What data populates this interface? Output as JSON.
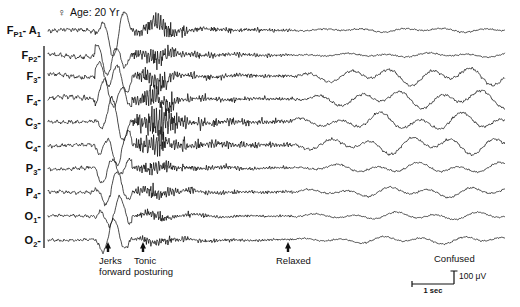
{
  "header": {
    "sex_symbol": "♀",
    "patient_info": "Age: 20 Yr"
  },
  "channels": [
    {
      "name": "Fp1-A1",
      "base": "F",
      "sub": "P1",
      "suffix": "- A",
      "ref_sub": "1",
      "y": 30
    },
    {
      "name": "Fp2-",
      "base": "F",
      "sub": "P2",
      "suffix": "-",
      "ref_sub": "",
      "y": 55
    },
    {
      "name": "F3-",
      "base": "F",
      "sub": "3",
      "suffix": "-",
      "ref_sub": "",
      "y": 76
    },
    {
      "name": "F4-",
      "base": "F",
      "sub": "4",
      "suffix": "-",
      "ref_sub": "",
      "y": 99
    },
    {
      "name": "C3-",
      "base": "C",
      "sub": "3",
      "suffix": "-",
      "ref_sub": "",
      "y": 122
    },
    {
      "name": "C4-",
      "base": "C",
      "sub": "4",
      "suffix": "-",
      "ref_sub": "",
      "y": 145
    },
    {
      "name": "P3-",
      "base": "P",
      "sub": "3",
      "suffix": "-",
      "ref_sub": "",
      "y": 168
    },
    {
      "name": "P4-",
      "base": "P",
      "sub": "4",
      "suffix": "-",
      "ref_sub": "",
      "y": 192
    },
    {
      "name": "O1-",
      "base": "O",
      "sub": "1",
      "suffix": "-",
      "ref_sub": "",
      "y": 216
    },
    {
      "name": "O2-",
      "base": "O",
      "sub": "2",
      "suffix": "-",
      "ref_sub": "",
      "y": 240
    }
  ],
  "annotations": [
    {
      "id": "jerks-forward",
      "line1": "Jerks",
      "line2": "forward",
      "arrow_x": 108,
      "text_x": 99,
      "text_y": 264
    },
    {
      "id": "tonic-posturing",
      "line1": "Tonic",
      "line2": "posturing",
      "arrow_x": 143,
      "text_x": 134,
      "text_y": 264
    },
    {
      "id": "relaxed",
      "line1": "Relaxed",
      "line2": "",
      "arrow_x": 288,
      "text_x": 276,
      "text_y": 264
    },
    {
      "id": "confused",
      "line1": "Confused",
      "line2": "",
      "arrow_x": null,
      "text_x": 434,
      "text_y": 262
    }
  ],
  "calibration": {
    "time_label": "1 sec",
    "amplitude_label": "100 μV",
    "x": 412,
    "y": 284,
    "width": 42,
    "height": 13
  },
  "chart_data": {
    "type": "line",
    "xlabel": "Time",
    "ylabel": "Channel (referential montage to A1)",
    "grid": false,
    "legend": null,
    "x_range_seconds": [
      0,
      19.6
    ],
    "seconds_per_pixel": 0.0429,
    "amplitude_scale_uv_per_px": 7.7,
    "n_channels": 10,
    "trace_x_start": 48,
    "trace_x_end": 505,
    "categories": [
      "Fp1-A1",
      "Fp2-",
      "F3-",
      "F4-",
      "C3-",
      "C4-",
      "P3-",
      "P4-",
      "O1-",
      "O2-"
    ],
    "phases": [
      {
        "name": "interictal baseline",
        "x_start": 48,
        "x_end": 95,
        "description": "low-voltage irregular background activity"
      },
      {
        "name": "movement artifact / jerks",
        "x_start": 95,
        "x_end": 130,
        "description": "large slow high-amplitude deflections from body jerking"
      },
      {
        "name": "tonic phase",
        "x_start": 130,
        "x_end": 180,
        "description": "high-frequency rhythmic low-amplitude fast activity with EMG"
      },
      {
        "name": "clonic / muscle artifact",
        "x_start": 180,
        "x_end": 290,
        "description": "bursts of muscle artifact decreasing in amplitude"
      },
      {
        "name": "post-ictal slowing",
        "x_start": 290,
        "x_end": 505,
        "description": "rhythmic high-amplitude delta slowing, confusion"
      }
    ],
    "series": [
      {
        "name": "Fp1-A1",
        "baseline_y": 30,
        "bursts": "slow-roll artifact then attenuation then mixed delta"
      },
      {
        "name": "Fp2-",
        "baseline_y": 55,
        "bursts": "slow-roll artifact then fast EMG then delta"
      },
      {
        "name": "F3-",
        "baseline_y": 76,
        "bursts": "strong tonic fast activity then rhythmic delta"
      },
      {
        "name": "F4-",
        "baseline_y": 99,
        "bursts": "strong tonic fast activity then rhythmic delta"
      },
      {
        "name": "C3-",
        "baseline_y": 122,
        "bursts": "highest amplitude EMG burst then delta"
      },
      {
        "name": "C4-",
        "baseline_y": 145,
        "bursts": "EMG burst then rhythmic delta"
      },
      {
        "name": "P3-",
        "baseline_y": 168,
        "bursts": "moderate EMG then low-voltage slowing"
      },
      {
        "name": "P4-",
        "baseline_y": 192,
        "bursts": "moderate EMG then low-voltage slowing"
      },
      {
        "name": "O1-",
        "baseline_y": 216,
        "bursts": "low-voltage throughout with late slowing"
      },
      {
        "name": "O2-",
        "baseline_y": 240,
        "bursts": "low-voltage throughout with late slowing"
      }
    ]
  }
}
